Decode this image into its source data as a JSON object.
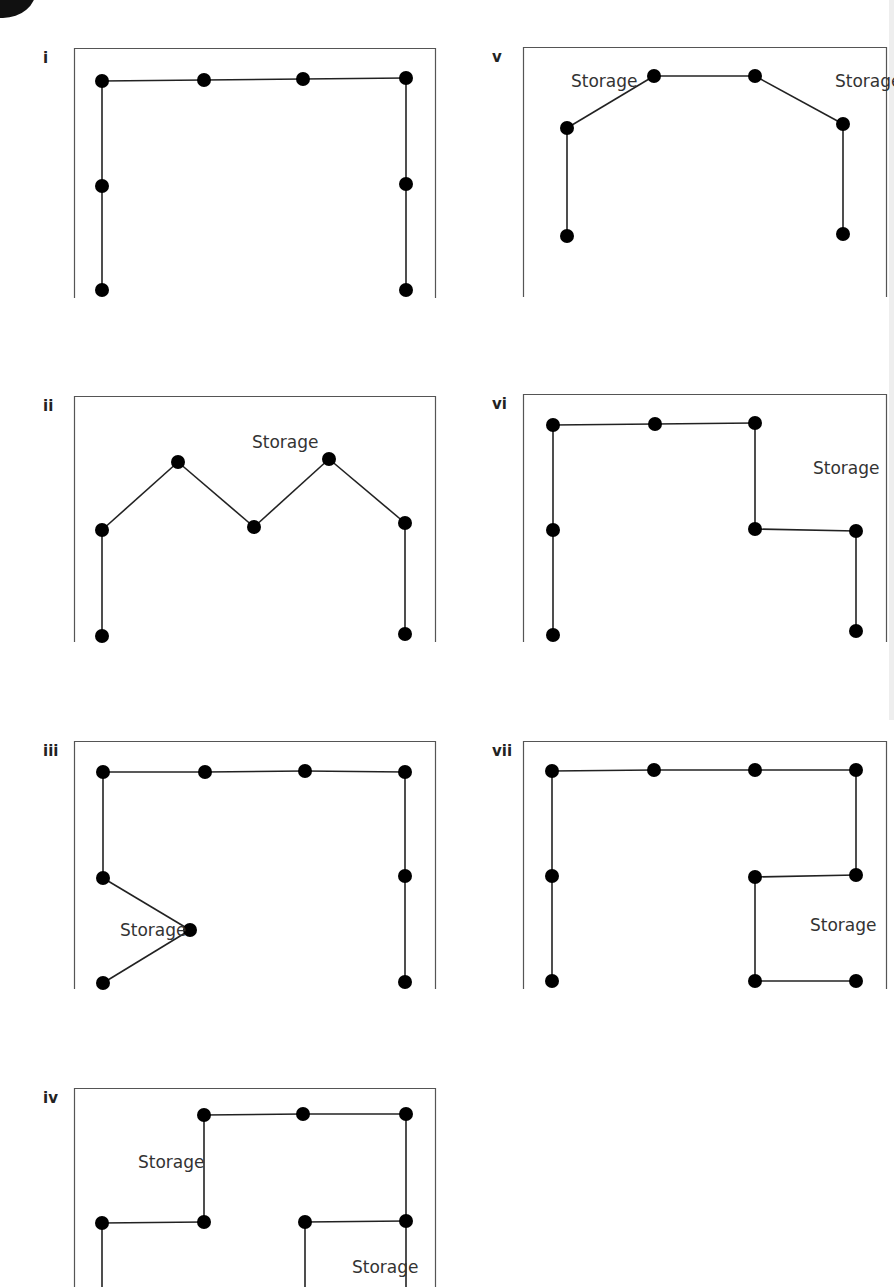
{
  "figure": {
    "storage_label": "Storage"
  },
  "panels": [
    {
      "id": "i",
      "label": "i",
      "box": {
        "x": 74,
        "y": 48,
        "w": 362,
        "h": 250
      },
      "points": [
        [
          28,
          33
        ],
        [
          130,
          32
        ],
        [
          229,
          31
        ],
        [
          332,
          30
        ],
        [
          28,
          138
        ],
        [
          332,
          136
        ],
        [
          28,
          242
        ],
        [
          332,
          242
        ]
      ],
      "edges": [
        [
          0,
          1
        ],
        [
          1,
          2
        ],
        [
          2,
          3
        ],
        [
          0,
          4
        ],
        [
          4,
          6
        ],
        [
          3,
          5
        ],
        [
          5,
          7
        ]
      ],
      "storage_labels": []
    },
    {
      "id": "ii",
      "label": "ii",
      "box": {
        "x": 74,
        "y": 396,
        "w": 362,
        "h": 246
      },
      "points": [
        [
          28,
          134
        ],
        [
          104,
          66
        ],
        [
          180,
          131
        ],
        [
          255,
          63
        ],
        [
          331,
          127
        ],
        [
          28,
          240
        ],
        [
          331,
          238
        ]
      ],
      "edges": [
        [
          0,
          1
        ],
        [
          1,
          2
        ],
        [
          2,
          3
        ],
        [
          3,
          4
        ],
        [
          0,
          5
        ],
        [
          4,
          6
        ]
      ],
      "storage_labels": [
        {
          "x": 178,
          "y": 52,
          "text": "Storage"
        }
      ]
    },
    {
      "id": "iii",
      "label": "iii",
      "box": {
        "x": 74,
        "y": 741,
        "w": 362,
        "h": 248
      },
      "points": [
        [
          29,
          31
        ],
        [
          131,
          31
        ],
        [
          231,
          30
        ],
        [
          331,
          31
        ],
        [
          29,
          137
        ],
        [
          116,
          189
        ],
        [
          29,
          242
        ],
        [
          331,
          135
        ],
        [
          331,
          241
        ]
      ],
      "edges": [
        [
          0,
          1
        ],
        [
          1,
          2
        ],
        [
          2,
          3
        ],
        [
          0,
          4
        ],
        [
          4,
          5
        ],
        [
          5,
          6
        ],
        [
          3,
          7
        ],
        [
          7,
          8
        ]
      ],
      "storage_labels": [
        {
          "x": 46,
          "y": 195,
          "text": "Storage"
        }
      ]
    },
    {
      "id": "iv",
      "label": "iv",
      "box": {
        "x": 74,
        "y": 1088,
        "w": 362,
        "h": 199
      },
      "points": [
        [
          130,
          27
        ],
        [
          229,
          26
        ],
        [
          332,
          26
        ],
        [
          28,
          135
        ],
        [
          130,
          134
        ],
        [
          231,
          134
        ],
        [
          332,
          133
        ]
      ],
      "edges": [
        [
          0,
          1
        ],
        [
          1,
          2
        ],
        [
          3,
          4
        ],
        [
          4,
          0
        ],
        [
          2,
          6
        ],
        [
          5,
          6
        ],
        [
          3,
          [
            28,
            210
          ]
        ],
        [
          5,
          [
            231,
            210
          ]
        ],
        [
          6,
          [
            332,
            210
          ]
        ]
      ],
      "storage_labels": [
        {
          "x": 64,
          "y": 80,
          "text": "Storage"
        },
        {
          "x": 278,
          "y": 185,
          "text": "Storage"
        }
      ]
    },
    {
      "id": "v",
      "label": "v",
      "box": {
        "x": 523,
        "y": 47,
        "w": 364,
        "h": 250
      },
      "points": [
        [
          44,
          81
        ],
        [
          131,
          29
        ],
        [
          232,
          29
        ],
        [
          320,
          77
        ],
        [
          44,
          189
        ],
        [
          320,
          187
        ]
      ],
      "edges": [
        [
          0,
          1
        ],
        [
          1,
          2
        ],
        [
          2,
          3
        ],
        [
          0,
          4
        ],
        [
          3,
          5
        ]
      ],
      "storage_labels": [
        {
          "x": 48,
          "y": 40,
          "text": "Storage"
        },
        {
          "x": 312,
          "y": 40,
          "text": "Storage"
        }
      ]
    },
    {
      "id": "vi",
      "label": "vi",
      "box": {
        "x": 523,
        "y": 394,
        "w": 364,
        "h": 248
      },
      "points": [
        [
          30,
          31
        ],
        [
          132,
          30
        ],
        [
          232,
          29
        ],
        [
          30,
          136
        ],
        [
          232,
          135
        ],
        [
          333,
          137
        ],
        [
          30,
          241
        ],
        [
          333,
          237
        ]
      ],
      "edges": [
        [
          0,
          1
        ],
        [
          1,
          2
        ],
        [
          2,
          4
        ],
        [
          4,
          5
        ],
        [
          5,
          7
        ],
        [
          0,
          3
        ],
        [
          3,
          6
        ]
      ],
      "storage_labels": [
        {
          "x": 290,
          "y": 80,
          "text": "Storage"
        }
      ]
    },
    {
      "id": "vii",
      "label": "vii",
      "box": {
        "x": 523,
        "y": 741,
        "w": 364,
        "h": 248
      },
      "points": [
        [
          29,
          30
        ],
        [
          131,
          29
        ],
        [
          232,
          29
        ],
        [
          333,
          29
        ],
        [
          29,
          135
        ],
        [
          232,
          136
        ],
        [
          333,
          134
        ],
        [
          29,
          240
        ],
        [
          232,
          240
        ],
        [
          333,
          240
        ]
      ],
      "edges": [
        [
          0,
          1
        ],
        [
          1,
          2
        ],
        [
          2,
          3
        ],
        [
          3,
          6
        ],
        [
          6,
          5
        ],
        [
          5,
          8
        ],
        [
          8,
          9
        ],
        [
          0,
          4
        ],
        [
          4,
          7
        ]
      ],
      "storage_labels": [
        {
          "x": 287,
          "y": 190,
          "text": "Storage"
        }
      ]
    }
  ]
}
